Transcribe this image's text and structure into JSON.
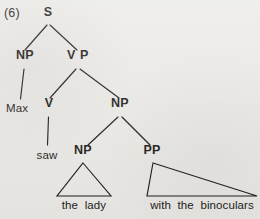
{
  "figure": {
    "example_number": "(6)",
    "kind": "syntactic-phrase-structure-tree",
    "sentence": "Max saw the lady with the binoculars",
    "background_color": "#ecebe7",
    "ink_color": "#1c1b1a"
  },
  "nodes": {
    "s": {
      "label": "S",
      "x": 48,
      "y": 12
    },
    "np_subject": {
      "label": "NP",
      "x": 25,
      "y": 55
    },
    "vp": {
      "label": "V P",
      "x": 78,
      "y": 55
    },
    "v": {
      "label": "V",
      "x": 49,
      "y": 103
    },
    "np_object": {
      "label": "NP",
      "x": 120,
      "y": 103
    },
    "np_inner": {
      "label": "NP",
      "x": 83,
      "y": 150
    },
    "pp": {
      "label": "PP",
      "x": 152,
      "y": 150
    }
  },
  "leaves": {
    "max": {
      "label": "Max",
      "x": 17,
      "y": 103
    },
    "saw": {
      "label": "saw",
      "x": 47,
      "y": 150
    },
    "the_lady": {
      "label": "the  lady",
      "x": 84,
      "y": 200
    },
    "with_the_binoculars": {
      "label": "with  the  binoculars",
      "x": 202,
      "y": 200
    }
  },
  "edges": [
    {
      "name": "s-to-np-subject",
      "from": "S",
      "to": "NP",
      "x1": 47,
      "y1": 25,
      "x2": 25,
      "y2": 50
    },
    {
      "name": "s-to-vp",
      "from": "S",
      "to": "VP",
      "x1": 50,
      "y1": 25,
      "x2": 77,
      "y2": 50
    },
    {
      "name": "np-subject-to-max",
      "from": "NP",
      "to": "Max",
      "x1": 24,
      "y1": 69,
      "x2": 20,
      "y2": 99
    },
    {
      "name": "vp-to-v",
      "from": "VP",
      "to": "V",
      "x1": 76,
      "y1": 69,
      "x2": 50,
      "y2": 98
    },
    {
      "name": "vp-to-np-object",
      "from": "VP",
      "to": "NP",
      "x1": 80,
      "y1": 69,
      "x2": 119,
      "y2": 98
    },
    {
      "name": "v-to-saw",
      "from": "V",
      "to": "saw",
      "x1": 48,
      "y1": 117,
      "x2": 47,
      "y2": 145
    },
    {
      "name": "np-object-to-np-inner",
      "from": "NP",
      "to": "NP",
      "x1": 118,
      "y1": 117,
      "x2": 88,
      "y2": 145
    },
    {
      "name": "np-object-to-pp",
      "from": "NP",
      "to": "PP",
      "x1": 122,
      "y1": 117,
      "x2": 150,
      "y2": 145
    }
  ],
  "triangles": [
    {
      "name": "np-inner-triangle",
      "covers": "the lady",
      "apex_x": 83,
      "apex_y": 163,
      "base_left_x": 57,
      "base_right_x": 111,
      "base_y": 196
    },
    {
      "name": "pp-triangle",
      "covers": "with the binoculars",
      "apex_x": 153,
      "apex_y": 163,
      "base_left_x": 147,
      "base_right_x": 257,
      "base_y": 196
    }
  ]
}
